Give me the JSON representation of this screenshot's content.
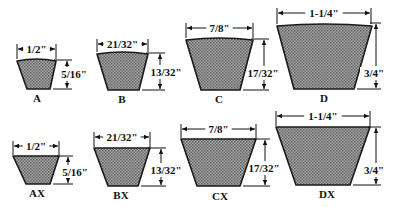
{
  "colors": {
    "fill": "#8c8c8c",
    "outline": "#1a1a1a",
    "ink": "#111111",
    "background": "#ffffff"
  },
  "belts": [
    {
      "id": "A",
      "name": "A",
      "width": "1/2\"",
      "height": "5/16\"",
      "shape": {
        "tl": 17,
        "tr": 56,
        "bl": 27,
        "br": 50,
        "top": 60,
        "bottom": 89
      },
      "wdim": {
        "y": 49,
        "x1": 17,
        "x2": 56
      },
      "hdim": {
        "x": 67,
        "y1": 60,
        "y2": 89
      },
      "hlabel": {
        "x": 74,
        "y": 78
      },
      "label": {
        "x": 37,
        "y": 102
      },
      "curved": true
    },
    {
      "id": "B",
      "name": "B",
      "width": "21/32\"",
      "height": "13/32\"",
      "shape": {
        "tl": 97,
        "tr": 148,
        "bl": 108,
        "br": 139,
        "top": 53,
        "bottom": 90
      },
      "wdim": {
        "y": 44,
        "x1": 97,
        "x2": 148
      },
      "hdim": {
        "x": 160,
        "y1": 53,
        "y2": 90
      },
      "hlabel": {
        "x": 166,
        "y": 76
      },
      "label": {
        "x": 122,
        "y": 103
      },
      "curved": true
    },
    {
      "id": "C",
      "name": "C",
      "width": "7/8\"",
      "height": "17/32\"",
      "shape": {
        "tl": 186,
        "tr": 253,
        "bl": 201,
        "br": 240,
        "top": 39,
        "bottom": 90
      },
      "wdim": {
        "y": 28,
        "x1": 186,
        "x2": 253
      },
      "hdim": {
        "x": 264,
        "y1": 39,
        "y2": 90
      },
      "hlabel": {
        "x": 263,
        "y": 77
      },
      "label": {
        "x": 219,
        "y": 103
      },
      "curved": true
    },
    {
      "id": "D",
      "name": "D",
      "width": "1-1/4\"",
      "height": "3/4\"",
      "shape": {
        "tl": 277,
        "tr": 372,
        "bl": 294,
        "br": 354,
        "top": 25,
        "bottom": 89
      },
      "wdim": {
        "y": 13,
        "x1": 277,
        "x2": 371
      },
      "hdim": {
        "x": 376,
        "y1": 23,
        "y2": 89
      },
      "hlabel": {
        "x": 374,
        "y": 77
      },
      "label": {
        "x": 324,
        "y": 102
      },
      "curved": true
    },
    {
      "id": "AX",
      "name": "AX",
      "width": "1/2\"",
      "height": "5/16\"",
      "shape": {
        "tl": 13,
        "tr": 59,
        "bl": 26,
        "br": 50,
        "top": 156,
        "bottom": 184
      },
      "wdim": {
        "y": 146,
        "x1": 13,
        "x2": 59
      },
      "hdim": {
        "x": 68,
        "y1": 156,
        "y2": 184
      },
      "hlabel": {
        "x": 75,
        "y": 176
      },
      "label": {
        "x": 37,
        "y": 197
      },
      "curved": false
    },
    {
      "id": "BX",
      "name": "BX",
      "width": "21/32\"",
      "height": "13/32\"",
      "shape": {
        "tl": 94,
        "tr": 150,
        "bl": 108,
        "br": 138,
        "top": 148,
        "bottom": 186
      },
      "wdim": {
        "y": 137,
        "x1": 94,
        "x2": 150
      },
      "hdim": {
        "x": 161,
        "y1": 148,
        "y2": 186
      },
      "hlabel": {
        "x": 166,
        "y": 174
      },
      "label": {
        "x": 121,
        "y": 199
      },
      "curved": false
    },
    {
      "id": "CX",
      "name": "CX",
      "width": "7/8\"",
      "height": "17/32\"",
      "shape": {
        "tl": 181,
        "tr": 256,
        "bl": 197,
        "br": 240,
        "top": 139,
        "bottom": 186
      },
      "wdim": {
        "y": 129,
        "x1": 181,
        "x2": 256
      },
      "hdim": {
        "x": 265,
        "y1": 139,
        "y2": 186
      },
      "hlabel": {
        "x": 264,
        "y": 172
      },
      "label": {
        "x": 220,
        "y": 200
      },
      "curved": false
    },
    {
      "id": "DX",
      "name": "DX",
      "width": "1-1/4\"",
      "height": "3/4\"",
      "shape": {
        "tl": 276,
        "tr": 370,
        "bl": 296,
        "br": 350,
        "top": 127,
        "bottom": 185
      },
      "wdim": {
        "y": 116,
        "x1": 276,
        "x2": 370
      },
      "hdim": {
        "x": 376,
        "y1": 127,
        "y2": 185
      },
      "hlabel": {
        "x": 374,
        "y": 174
      },
      "label": {
        "x": 327,
        "y": 198
      },
      "curved": false
    }
  ]
}
